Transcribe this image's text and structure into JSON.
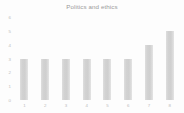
{
  "chart_data": {
    "type": "bar",
    "title": "Politics and ethics",
    "xlabel": "",
    "ylabel": "",
    "categories": [
      "1",
      "2",
      "3",
      "4",
      "5",
      "6",
      "7",
      "8"
    ],
    "values": [
      3,
      3,
      3,
      3,
      3,
      3,
      4,
      5
    ],
    "ylim": [
      0,
      6
    ],
    "yticks": [
      "0",
      "1",
      "2",
      "3",
      "4",
      "5",
      "6"
    ],
    "ytick_values": [
      0,
      1,
      2,
      3,
      4,
      5,
      6
    ],
    "grid": false,
    "legend": null,
    "bar_color": "#d4d4d4",
    "text_color": "#bcbcbc",
    "title_color": "#9a9a9a",
    "background_color": "#fdfdfd"
  }
}
